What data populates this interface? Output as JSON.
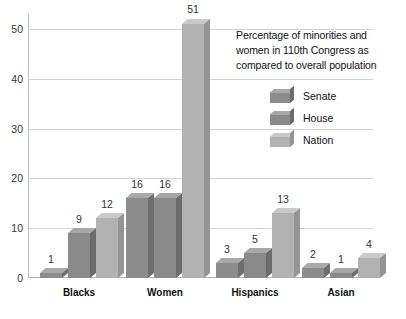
{
  "chart_data": {
    "type": "bar",
    "title": "",
    "xlabel": "",
    "ylabel": "",
    "categories": [
      "Blacks",
      "Women",
      "Hispanics",
      "Asian"
    ],
    "series": [
      {
        "name": "Senate",
        "values": [
          1,
          16,
          3,
          2
        ],
        "color": "#8c8c8c"
      },
      {
        "name": "House",
        "values": [
          9,
          16,
          5,
          1
        ],
        "color": "#8a8a8a"
      },
      {
        "name": "Nation",
        "values": [
          12,
          51,
          13,
          4
        ],
        "color": "#b2b2b2"
      }
    ],
    "ylim": [
      0,
      53
    ],
    "yticks": [
      0,
      10,
      20,
      30,
      40,
      50
    ],
    "ytick_labels": [
      "0",
      "10",
      "20",
      "30",
      "40",
      "50"
    ],
    "grid": true,
    "legend_position": "upper-right",
    "data_labels": true
  },
  "legend": {
    "caption_lines": [
      "Percentage of minorities and",
      "women in 110th Congress as",
      "compared to overall population"
    ],
    "items": [
      {
        "label": "Senate"
      },
      {
        "label": "House"
      },
      {
        "label": "Nation"
      }
    ]
  },
  "colors": {
    "grid": "#d3d3d3",
    "axis": "#bdbdbd",
    "text": "#333333",
    "background": "#ffffff",
    "senate_front": "#8c8c8c",
    "senate_top": "#a9a9a9",
    "senate_side": "#6e6e6e",
    "house_front": "#8a8a8a",
    "house_top": "#a7a7a7",
    "house_side": "#6c6c6c",
    "nation_front": "#b2b2b2",
    "nation_top": "#c9c9c9",
    "nation_side": "#949494"
  }
}
